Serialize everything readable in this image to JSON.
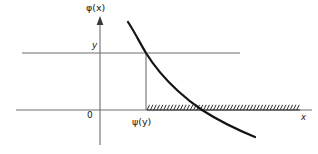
{
  "figure": {
    "title": "",
    "background_color": "#ffffff",
    "labels": {
      "vertical_axis": "φ(x)",
      "horizontal_axis": "x",
      "origin": "0",
      "level_y": "y",
      "abscissa_psi": "ψ(y)"
    },
    "colors": {
      "curve": "#141414",
      "axis": "#6e6e6e",
      "hatching": "#2a2a2a",
      "text": "#181818"
    }
  },
  "chart_data": {
    "type": "line",
    "title": "",
    "xlabel": "x",
    "ylabel": "φ(x)",
    "grid": false,
    "legend": null,
    "xlim": [
      16,
      312
    ],
    "ylim": [
      145,
      14
    ],
    "annotations": [
      {
        "text": "φ(x)",
        "role": "vertical-axis-label",
        "x": 100,
        "y": 12
      },
      {
        "text": "y",
        "role": "level-value-label",
        "x": 95,
        "y": 45
      },
      {
        "text": "0",
        "role": "origin-label",
        "x": 90,
        "y": 115
      },
      {
        "text": "ψ(y)",
        "role": "abscissa-label",
        "x": 146,
        "y": 121
      },
      {
        "text": "x",
        "role": "horizontal-axis-label",
        "x": 303,
        "y": 117
      }
    ],
    "series": [
      {
        "name": "phi(x)",
        "type": "curve",
        "description": "decreasing convex-to-concave curve crossing the level y then the x-axis",
        "points": [
          [
            128,
            22
          ],
          [
            137,
            37
          ],
          [
            146,
            53
          ],
          [
            156,
            67
          ],
          [
            167,
            80
          ],
          [
            178,
            91
          ],
          [
            190,
            101
          ],
          [
            202,
            110
          ],
          [
            215,
            118
          ],
          [
            228,
            125
          ],
          [
            241,
            131
          ],
          [
            255,
            137
          ]
        ]
      },
      {
        "name": "level-line-y",
        "type": "horizontal-reference",
        "y": 53,
        "x_start": 22,
        "x_end": 240
      },
      {
        "name": "x-axis",
        "type": "horizontal-axis",
        "y": 110,
        "x_start": 16,
        "x_end": 312
      },
      {
        "name": "vertical-axis",
        "type": "vertical-axis",
        "x": 100,
        "y_start": 20,
        "y_end": 145
      },
      {
        "name": "dropline-psi",
        "type": "vertical-reference",
        "x": 146,
        "y_start": 53,
        "y_end": 110
      },
      {
        "name": "hatched-region",
        "type": "hatching",
        "y": 110,
        "x_start": 147,
        "x_end": 300,
        "tick_count": 46,
        "side": "above"
      }
    ]
  }
}
